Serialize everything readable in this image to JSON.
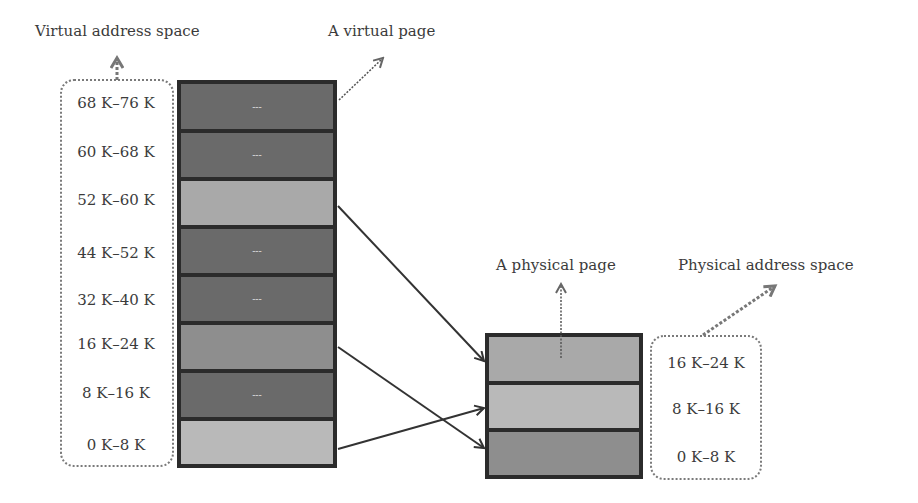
{
  "labels": {
    "virtual_space": "Virtual address space",
    "virtual_page": "A virtual page",
    "physical_page": "A physical page",
    "physical_space": "Physical address space"
  },
  "virtual_pages": [
    {
      "range": "68 K–76 K",
      "mapped": false,
      "marker": "---",
      "color": "#6a6a6a"
    },
    {
      "range": "60 K–68 K",
      "mapped": false,
      "marker": "---",
      "color": "#6a6a6a"
    },
    {
      "range": "52 K–60 K",
      "mapped": true,
      "marker": "",
      "color": "#a9a9a9"
    },
    {
      "range": "44 K–52 K",
      "mapped": false,
      "marker": "---",
      "color": "#6a6a6a"
    },
    {
      "range": "32 K–40 K",
      "mapped": false,
      "marker": "---",
      "color": "#6a6a6a"
    },
    {
      "range": "16 K–24 K",
      "mapped": true,
      "marker": "",
      "color": "#8e8e8e"
    },
    {
      "range": "8 K–16 K",
      "mapped": false,
      "marker": "---",
      "color": "#6a6a6a"
    },
    {
      "range": "0 K–8 K",
      "mapped": true,
      "marker": "",
      "color": "#b9b9b9"
    }
  ],
  "physical_pages": [
    {
      "range": "16 K–24 K",
      "color": "#a9a9a9"
    },
    {
      "range": "8 K–16 K",
      "color": "#b9b9b9"
    },
    {
      "range": "0 K–8 K",
      "color": "#8e8e8e"
    }
  ],
  "mappings": [
    {
      "from": "52 K–60 K",
      "to": "16 K–24 K"
    },
    {
      "from": "16 K–24 K",
      "to": "0 K–8 K"
    },
    {
      "from": "0 K–8 K",
      "to": "8 K–16 K"
    }
  ]
}
